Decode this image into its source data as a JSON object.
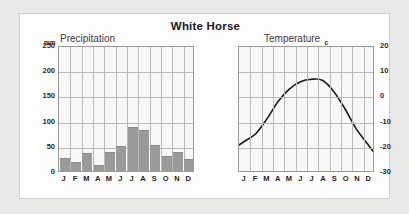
{
  "title": "White Horse",
  "precipitation": {
    "unit": "mm",
    "axis_name": "Precipitation",
    "y_ticks": [
      250,
      200,
      150,
      100,
      50,
      0
    ],
    "ylim": [
      0,
      250
    ]
  },
  "temperature": {
    "unit": "c",
    "axis_name": "Temperature",
    "y_ticks": [
      20,
      10,
      0,
      -10,
      -20,
      -30
    ],
    "ylim": [
      -30,
      20
    ]
  },
  "months": [
    "J",
    "F",
    "M",
    "A",
    "M",
    "J",
    "J",
    "A",
    "S",
    "O",
    "N",
    "D"
  ],
  "colors": {
    "bar": "#9a9a98",
    "grid": "#b9b9b7",
    "plot_background": "#f7f7f5",
    "card_background": "#fdfdfd",
    "page_background": "#e9e9e7",
    "curve": "#1a1a1a",
    "border": "#9b9b99"
  },
  "chart_data": [
    {
      "type": "bar",
      "title": "White Horse",
      "subtitle": "Precipitation",
      "xlabel": "",
      "ylabel": "Precipitation",
      "yunit": "mm",
      "categories": [
        "J",
        "F",
        "M",
        "A",
        "M",
        "J",
        "J",
        "A",
        "S",
        "O",
        "N",
        "D"
      ],
      "values": [
        25,
        17,
        35,
        12,
        38,
        50,
        87,
        81,
        51,
        29,
        38,
        23
      ],
      "ylim": [
        0,
        250
      ],
      "yticks": [
        0,
        50,
        100,
        150,
        200,
        250
      ],
      "grid": true,
      "legend": "none"
    },
    {
      "type": "line",
      "title": "White Horse",
      "subtitle": "Temperature",
      "xlabel": "",
      "ylabel": "Temperature",
      "yunit": "c",
      "categories": [
        "J",
        "F",
        "M",
        "A",
        "M",
        "J",
        "J",
        "A",
        "S",
        "O",
        "N",
        "D"
      ],
      "values": [
        -18,
        -15,
        -9,
        -2,
        3,
        6,
        7,
        6.5,
        2,
        -5,
        -13,
        -19
      ],
      "ylim": [
        -30,
        20
      ],
      "yticks": [
        -30,
        -20,
        -10,
        0,
        10,
        20
      ],
      "grid": true,
      "legend": "none"
    }
  ]
}
